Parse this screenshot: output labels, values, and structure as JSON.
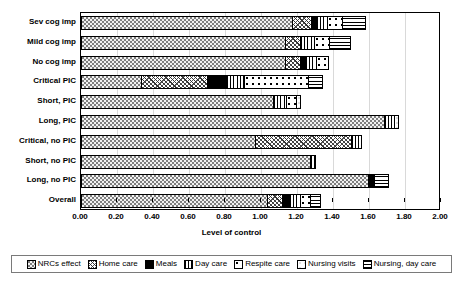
{
  "chart_data": {
    "type": "bar",
    "orientation": "horizontal",
    "stacked": true,
    "title": "",
    "xlabel": "Level of control",
    "ylabel": "",
    "xlim": [
      0,
      2
    ],
    "xticks": [
      "0.00",
      "0.20",
      "0.40",
      "0.60",
      "0.80",
      "1.00",
      "1.20",
      "1.40",
      "1.60",
      "1.80",
      "2.00"
    ],
    "grid": true,
    "legend_position": "bottom",
    "categories": [
      "Sev cog imp",
      "Mild cog imp",
      "No cog imp",
      "Critical PIC",
      "Short, PIC",
      "Long, PIC",
      "Critical, no PIC",
      "Short, no PIC",
      "Long, no PIC",
      "Overall"
    ],
    "series": [
      {
        "name": "NRCs effect",
        "pattern": "fine-dotted",
        "values": [
          1.18,
          1.14,
          1.14,
          0.34,
          1.07,
          1.69,
          0.97,
          1.28,
          1.6,
          1.04
        ]
      },
      {
        "name": "Home care",
        "pattern": "cross-hatch",
        "values": [
          0.11,
          0.09,
          0.09,
          0.37,
          0.0,
          0.0,
          0.54,
          0.0,
          0.0,
          0.09
        ]
      },
      {
        "name": "Meals",
        "pattern": "solid-black",
        "values": [
          0.03,
          0.0,
          0.03,
          0.11,
          0.0,
          0.0,
          0.0,
          0.0,
          0.04,
          0.04
        ]
      },
      {
        "name": "Day care",
        "pattern": "vertical-lines",
        "values": [
          0.07,
          0.08,
          0.07,
          0.11,
          0.08,
          0.06,
          0.06,
          0.03,
          0.0,
          0.07
        ]
      },
      {
        "name": "Respite care",
        "pattern": "coarse-dots",
        "values": [
          0.09,
          0.09,
          0.07,
          0.36,
          0.06,
          0.0,
          0.0,
          0.0,
          0.0,
          0.06
        ]
      },
      {
        "name": "Nursing visits",
        "pattern": "light-stipple",
        "values": [
          0.0,
          0.0,
          0.0,
          0.0,
          0.03,
          0.03,
          0.0,
          0.0,
          0.0,
          0.0
        ]
      },
      {
        "name": "Nursing, day care",
        "pattern": "horizontal-lines",
        "values": [
          0.13,
          0.12,
          0.0,
          0.08,
          0.0,
          0.0,
          0.0,
          0.0,
          0.08,
          0.06
        ]
      }
    ]
  },
  "legend": {
    "items": [
      {
        "label": "NRCs effect",
        "pattern": "fine-dotted"
      },
      {
        "label": "Home care",
        "pattern": "cross-hatch"
      },
      {
        "label": "Meals",
        "pattern": "solid-black"
      },
      {
        "label": "Day care",
        "pattern": "vertical-lines"
      },
      {
        "label": "Respite care",
        "pattern": "coarse-dots"
      },
      {
        "label": "Nursing visits",
        "pattern": "light-stipple"
      },
      {
        "label": "Nursing, day care",
        "pattern": "horizontal-lines"
      }
    ]
  },
  "colors": {
    "axis": "#000000",
    "grid": "#d9d9d9",
    "legend_border": "#7a7a7a",
    "background": "#ffffff"
  }
}
